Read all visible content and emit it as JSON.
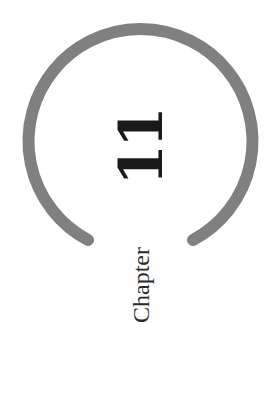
{
  "chapter": {
    "label": "Chapter",
    "number": "11"
  },
  "colors": {
    "arc": "#808080",
    "text": "#1a1a1a",
    "background": "#ffffff"
  }
}
